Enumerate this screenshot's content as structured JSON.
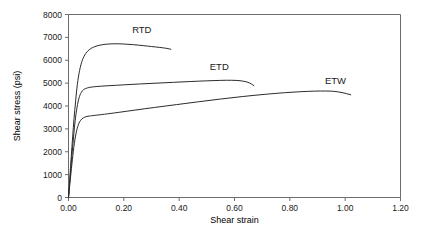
{
  "chart_data": {
    "type": "line",
    "title": "",
    "xlabel": "Shear strain",
    "ylabel": "Shear stress (psi)",
    "xlim": [
      0.0,
      1.2
    ],
    "ylim": [
      0,
      8000
    ],
    "grid": false,
    "legend_position": "inline-annotations",
    "xticks": [
      "0.00",
      "0.20",
      "0.40",
      "0.60",
      "0.80",
      "1.00",
      "1.20"
    ],
    "xtick_values": [
      0.0,
      0.2,
      0.4,
      0.6,
      0.8,
      1.0,
      1.2
    ],
    "yticks": [
      "0",
      "1000",
      "2000",
      "3000",
      "4000",
      "5000",
      "6000",
      "7000",
      "8000"
    ],
    "ytick_values": [
      0,
      1000,
      2000,
      3000,
      4000,
      5000,
      6000,
      7000,
      8000
    ],
    "series": [
      {
        "name": "RTD",
        "label_text": "RTD",
        "color": "#2b2b2b",
        "points": [
          [
            0.0,
            0
          ],
          [
            0.005,
            900
          ],
          [
            0.01,
            1800
          ],
          [
            0.015,
            2650
          ],
          [
            0.02,
            3450
          ],
          [
            0.026,
            4250
          ],
          [
            0.032,
            4950
          ],
          [
            0.04,
            5550
          ],
          [
            0.05,
            6000
          ],
          [
            0.062,
            6290
          ],
          [
            0.075,
            6460
          ],
          [
            0.09,
            6570
          ],
          [
            0.11,
            6650
          ],
          [
            0.135,
            6700
          ],
          [
            0.165,
            6720
          ],
          [
            0.2,
            6710
          ],
          [
            0.235,
            6680
          ],
          [
            0.27,
            6640
          ],
          [
            0.3,
            6600
          ],
          [
            0.33,
            6560
          ],
          [
            0.355,
            6520
          ],
          [
            0.37,
            6480
          ]
        ]
      },
      {
        "name": "ETD",
        "label_text": "ETD",
        "color": "#2b2b2b",
        "points": [
          [
            0.0,
            0
          ],
          [
            0.006,
            900
          ],
          [
            0.012,
            1800
          ],
          [
            0.018,
            2600
          ],
          [
            0.024,
            3350
          ],
          [
            0.031,
            3950
          ],
          [
            0.038,
            4350
          ],
          [
            0.046,
            4590
          ],
          [
            0.055,
            4720
          ],
          [
            0.068,
            4790
          ],
          [
            0.085,
            4830
          ],
          [
            0.11,
            4860
          ],
          [
            0.15,
            4890
          ],
          [
            0.2,
            4925
          ],
          [
            0.26,
            4965
          ],
          [
            0.32,
            5000
          ],
          [
            0.38,
            5035
          ],
          [
            0.44,
            5070
          ],
          [
            0.5,
            5100
          ],
          [
            0.55,
            5120
          ],
          [
            0.59,
            5125
          ],
          [
            0.62,
            5105
          ],
          [
            0.645,
            5050
          ],
          [
            0.66,
            4970
          ],
          [
            0.67,
            4890
          ]
        ]
      },
      {
        "name": "ETW",
        "label_text": "ETW",
        "color": "#2b2b2b",
        "points": [
          [
            0.0,
            0
          ],
          [
            0.007,
            850
          ],
          [
            0.014,
            1650
          ],
          [
            0.021,
            2350
          ],
          [
            0.029,
            2900
          ],
          [
            0.038,
            3250
          ],
          [
            0.048,
            3430
          ],
          [
            0.06,
            3520
          ],
          [
            0.075,
            3560
          ],
          [
            0.095,
            3590
          ],
          [
            0.13,
            3640
          ],
          [
            0.18,
            3720
          ],
          [
            0.24,
            3820
          ],
          [
            0.31,
            3935
          ],
          [
            0.39,
            4060
          ],
          [
            0.47,
            4185
          ],
          [
            0.55,
            4305
          ],
          [
            0.63,
            4415
          ],
          [
            0.71,
            4510
          ],
          [
            0.78,
            4580
          ],
          [
            0.84,
            4625
          ],
          [
            0.89,
            4650
          ],
          [
            0.93,
            4655
          ],
          [
            0.96,
            4640
          ],
          [
            0.985,
            4595
          ],
          [
            1.005,
            4540
          ],
          [
            1.02,
            4490
          ]
        ]
      }
    ],
    "annotations": [
      {
        "text": "RTD",
        "x": 0.265,
        "y": 7180
      },
      {
        "text": "ETD",
        "x": 0.545,
        "y": 5560
      },
      {
        "text": "ETW",
        "x": 0.965,
        "y": 4980
      }
    ]
  }
}
